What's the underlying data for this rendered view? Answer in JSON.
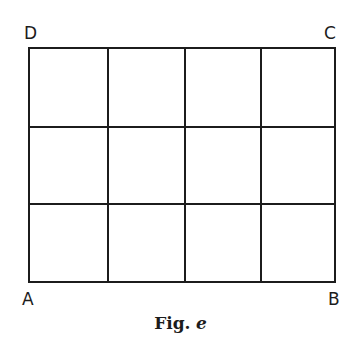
{
  "figure": {
    "caption_prefix": "Fig.",
    "caption_letter": "e",
    "corners": {
      "top_left": "D",
      "top_right": "C",
      "bottom_left": "A",
      "bottom_right": "B"
    }
  },
  "grid": {
    "columns": 4,
    "rows": 3,
    "x_lines": [
      29,
      108,
      185,
      261,
      335
    ],
    "y_lines": [
      48,
      127,
      204,
      282
    ],
    "stroke": "#1c1c1c"
  }
}
